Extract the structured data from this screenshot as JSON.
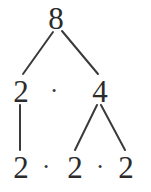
{
  "diagram": {
    "type": "factor-tree",
    "stroke_color": "#3a3a3a",
    "text_color": "#2b2b2b",
    "background_color": "#ffffff",
    "nodes": {
      "root": "8",
      "level2_left": "2",
      "level2_operator": "·",
      "level2_right": "4",
      "level3_first": "2",
      "level3_operator_1": "·",
      "level3_second": "2",
      "level3_operator_2": "·",
      "level3_third": "2"
    },
    "expressions": {
      "level2": "2 · 4",
      "level3": "2 · 2 · 2"
    }
  }
}
